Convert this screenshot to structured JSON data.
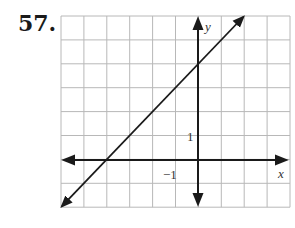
{
  "problem_number": "57.",
  "chart_data": {
    "type": "line",
    "title": "",
    "xlabel": "x",
    "ylabel": "y",
    "xlim": [
      -6,
      4
    ],
    "ylim": [
      -2,
      6
    ],
    "grid": true,
    "tick_labels": {
      "x": [
        "−1"
      ],
      "y": [
        "1"
      ]
    },
    "series": [
      {
        "name": "y = x + 4",
        "x": [
          -6,
          -4,
          0,
          2
        ],
        "y": [
          -2,
          0,
          4,
          6
        ]
      }
    ],
    "annotations": [
      "arrows at both ends of line",
      "arrows at both ends of axes"
    ]
  },
  "labels": {
    "x_axis": "x",
    "y_axis": "y",
    "x_tick": "−1",
    "y_tick": "1"
  }
}
